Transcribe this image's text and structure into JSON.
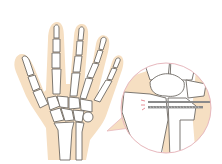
{
  "illustration": {
    "subject": "hand-skeleton-with-wrist-fracture-fixation",
    "colors": {
      "background": "#ffffff",
      "skin": "#f6dfc2",
      "bone_fill": "#ffffff",
      "bone_stroke": "#6e6a64",
      "callout_circle": "#e7b8be",
      "screw": "#8a8a8a",
      "fracture_marks": "#e0737f"
    }
  }
}
